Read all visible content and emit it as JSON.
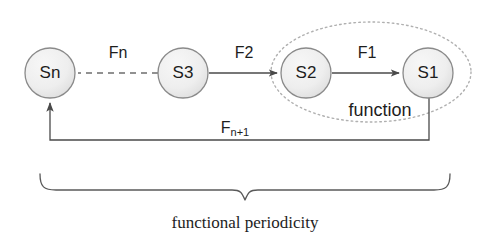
{
  "diagram": {
    "caption": "functional periodicity",
    "group_label": "function",
    "colors": {
      "node_fill_light": "#f3f3f3",
      "node_fill_dark": "#dedede",
      "node_stroke": "#8a8a8a",
      "line": "#4a4a4a",
      "dashed_line": "#6e6e6e",
      "dotted_ellipse": "#b0b0b0",
      "text": "#1d1d1d",
      "background": "#ffffff"
    },
    "nodes": [
      {
        "id": "Sn",
        "label": "Sn",
        "cx": 50,
        "cy": 73,
        "r": 25
      },
      {
        "id": "S3",
        "label": "S3",
        "cx": 183,
        "cy": 73,
        "r": 25
      },
      {
        "id": "S2",
        "label": "S2",
        "cx": 306,
        "cy": 73,
        "r": 25
      },
      {
        "id": "S1",
        "label": "S1",
        "cx": 428,
        "cy": 73,
        "r": 25
      }
    ],
    "edges": [
      {
        "id": "fn",
        "label": "Fn",
        "from": "S3",
        "to": "Sn",
        "style": "dashed",
        "arrow": false,
        "label_x": 118,
        "label_y": 58
      },
      {
        "id": "f2",
        "label": "F2",
        "from": "S3",
        "to": "S2",
        "style": "solid",
        "arrow": true,
        "label_x": 244,
        "label_y": 58
      },
      {
        "id": "f1",
        "label": "F1",
        "from": "S2",
        "to": "S1",
        "style": "solid",
        "arrow": true,
        "label_x": 367,
        "label_y": 58
      }
    ],
    "feedback_edge": {
      "id": "fn1",
      "label_main": "F",
      "label_sub": "n+1",
      "label_x": 235,
      "label_y": 133,
      "from": "S1",
      "to": "Sn"
    },
    "group_ellipse": {
      "cx": 371,
      "cy": 72,
      "rx": 100,
      "ry": 50,
      "label_x": 380,
      "label_y": 116
    },
    "brace": {
      "left_x": 40,
      "right_x": 450,
      "top_y": 172,
      "tip_y": 200,
      "center_x": 245
    },
    "caption_position": {
      "x": 245,
      "y": 228
    }
  }
}
